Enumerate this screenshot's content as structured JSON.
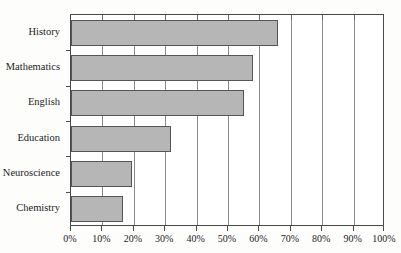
{
  "chart_data": {
    "type": "bar",
    "orientation": "horizontal",
    "title": "",
    "subtitle": "",
    "xlabel": "",
    "ylabel": "",
    "categories": [
      "History",
      "Mathematics",
      "English",
      "Education",
      "Neuroscience",
      "Chemistry"
    ],
    "values": [
      66,
      58,
      55,
      32,
      19.5,
      16.5
    ],
    "series": [
      {
        "name": "Percent",
        "values": [
          66,
          58,
          55,
          32,
          19.5,
          16.5
        ]
      }
    ],
    "xlim": [
      0,
      100
    ],
    "xticks": [
      0,
      10,
      20,
      30,
      40,
      50,
      60,
      70,
      80,
      90,
      100
    ],
    "xticklabels": [
      "0%",
      "10%",
      "20%",
      "30%",
      "40%",
      "50%",
      "60%",
      "70%",
      "80%",
      "90%",
      "100%"
    ],
    "grid": true,
    "grid_axis": "x",
    "legend": false,
    "legend_position": "none",
    "bar_color": "#b6b6b6",
    "bar_edge_color": "#555555",
    "axis_color": "#4a4a4a",
    "grid_color": "#8a8a8a",
    "background_color": "#ffffff"
  }
}
